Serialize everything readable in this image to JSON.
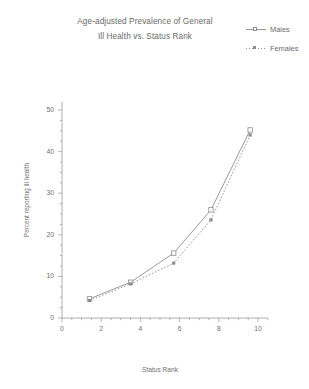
{
  "chart_data": {
    "type": "line",
    "title": "Age-adjusted Prevalence of General Ill Health vs. Status Rank",
    "title_lines": [
      "Age-adjusted Prevalence of General",
      "Ill Health vs. Status Rank"
    ],
    "xlabel": "Status Rank",
    "ylabel": "Percent reporting ill health",
    "xlim": [
      0,
      10.5
    ],
    "ylim": [
      0,
      52
    ],
    "xticks": [
      0,
      2,
      4,
      6,
      8,
      10
    ],
    "xtick_labels": [
      "0",
      "2",
      "4",
      "6",
      "8",
      "10"
    ],
    "yticks": [
      0,
      10,
      20,
      30,
      40,
      50
    ],
    "ytick_labels": [
      "0",
      "10",
      "20",
      "30",
      "40",
      "50"
    ],
    "minor_xtick_interval": 0.5,
    "minor_ytick_interval": 2.5,
    "grid": false,
    "legend_position": "top-right",
    "x": [
      1.4,
      3.5,
      5.7,
      7.6,
      9.6
    ],
    "series": [
      {
        "name": "Males",
        "marker": "open-square",
        "linestyle": "solid",
        "color": "#8d8d8d",
        "values": [
          4.6,
          8.6,
          15.6,
          26.0,
          45.2
        ]
      },
      {
        "name": "Females",
        "marker": "filled-square",
        "linestyle": "dotted",
        "color": "#8d8d8d",
        "values": [
          4.2,
          8.2,
          13.2,
          23.6,
          44.0
        ]
      }
    ]
  },
  "legend": {
    "entries": [
      {
        "label": "Males",
        "marker": "open-square-icon"
      },
      {
        "label": "Females",
        "marker": "filled-square-icon"
      }
    ]
  },
  "colors": {
    "line": "#8d8d8d",
    "axis": "#9a9a9a",
    "text": "#6a6a6a",
    "background": "#ffffff"
  }
}
